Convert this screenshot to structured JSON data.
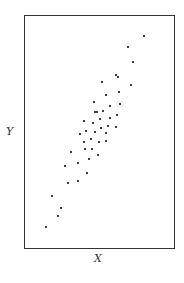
{
  "chart_data": {
    "type": "scatter",
    "title": "",
    "xlabel": "X",
    "ylabel": "Y",
    "grid": false,
    "legend": null,
    "frame_px": {
      "left": 24,
      "top": 15,
      "right": 174,
      "bottom": 248
    },
    "xlim": [
      0,
      150
    ],
    "ylim": [
      0,
      233
    ],
    "points": [
      [
        120,
        212
      ],
      [
        104,
        201
      ],
      [
        109,
        186
      ],
      [
        92,
        173
      ],
      [
        94,
        171
      ],
      [
        78,
        166
      ],
      [
        107,
        163
      ],
      [
        95,
        156
      ],
      [
        82,
        153
      ],
      [
        70,
        146
      ],
      [
        86,
        142
      ],
      [
        96,
        144
      ],
      [
        71,
        136
      ],
      [
        73,
        136
      ],
      [
        79,
        137
      ],
      [
        93,
        133
      ],
      [
        60,
        127
      ],
      [
        76,
        129
      ],
      [
        86,
        130
      ],
      [
        69,
        125
      ],
      [
        84,
        122
      ],
      [
        92,
        121
      ],
      [
        62,
        117
      ],
      [
        71,
        116
      ],
      [
        77,
        120
      ],
      [
        82,
        115
      ],
      [
        56,
        114
      ],
      [
        67,
        109
      ],
      [
        60,
        106
      ],
      [
        75,
        106
      ],
      [
        82,
        107
      ],
      [
        47,
        96
      ],
      [
        61,
        99
      ],
      [
        68,
        99
      ],
      [
        74,
        93
      ],
      [
        65,
        89
      ],
      [
        54,
        85
      ],
      [
        41,
        82
      ],
      [
        63,
        75
      ],
      [
        44,
        65
      ],
      [
        54,
        67
      ],
      [
        28,
        52
      ],
      [
        37,
        40
      ],
      [
        34,
        32
      ],
      [
        22,
        21
      ]
    ],
    "marker_color": "#111111",
    "frame_color": "#333333"
  }
}
